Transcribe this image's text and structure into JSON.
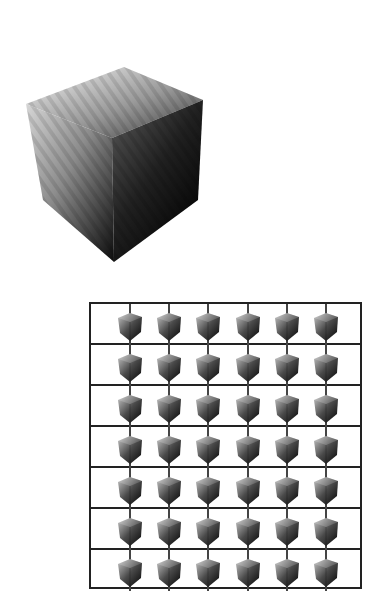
{
  "figure": {
    "large_cube": {
      "shape": "cube",
      "shading": "grayscale gradient, light top-left to black bottom-right, faint diagonal striations",
      "colors": {
        "light": "#f2f2f2",
        "mid": "#8a8a8a",
        "dark": "#050505"
      }
    },
    "grid": {
      "rows": 7,
      "columns": 6,
      "cell_glyph": "small-shaded-cube",
      "border_color": "#222222",
      "stem_color": "#444444"
    }
  }
}
